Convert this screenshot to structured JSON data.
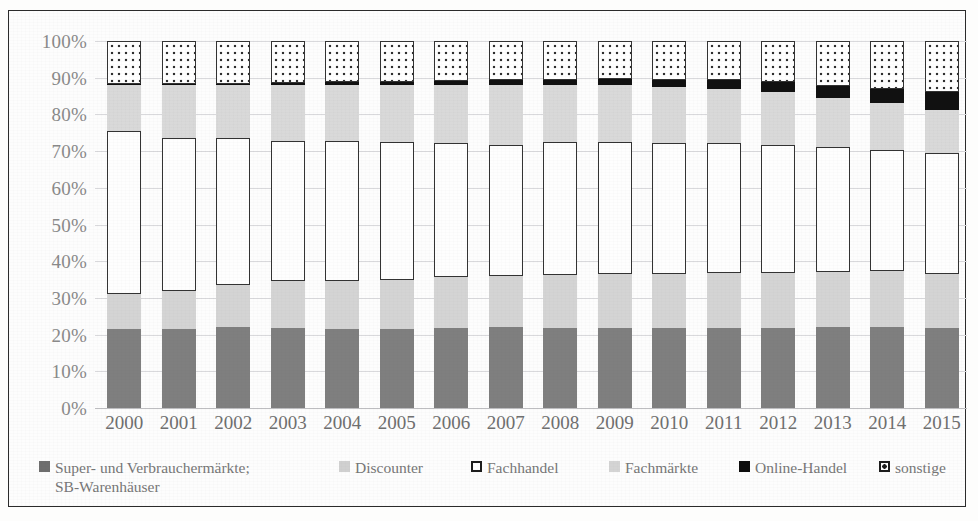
{
  "chart_data": {
    "type": "bar",
    "subtype": "stacked-percentage",
    "title": "",
    "xlabel": "",
    "ylabel": "",
    "ylim": [
      0,
      100
    ],
    "grid": true,
    "legend_position": "bottom",
    "ytick_labels": [
      "100%",
      "90%",
      "80%",
      "70%",
      "60%",
      "50%",
      "40%",
      "30%",
      "20%",
      "10%",
      "0%"
    ],
    "ytick_values": [
      100,
      90,
      80,
      70,
      60,
      50,
      40,
      30,
      20,
      10,
      0
    ],
    "categories": [
      "2000",
      "2001",
      "2002",
      "2003",
      "2004",
      "2005",
      "2006",
      "2007",
      "2008",
      "2009",
      "2010",
      "2011",
      "2012",
      "2013",
      "2014",
      "2015"
    ],
    "series": [
      {
        "name": "Super- und Verbrauchermärkte; SB-Warenhäuser",
        "color": "#7f7f7f",
        "values": [
          21.5,
          21.5,
          22.0,
          21.8,
          21.5,
          21.5,
          21.8,
          22.0,
          21.8,
          21.8,
          21.8,
          21.8,
          21.8,
          22.0,
          22.0,
          21.8
        ]
      },
      {
        "name": "Discounter",
        "color": "#d4d4d4",
        "values": [
          9.5,
          10.5,
          11.5,
          12.8,
          13.2,
          13.5,
          13.8,
          14.0,
          14.5,
          14.8,
          14.8,
          15.0,
          15.0,
          15.0,
          15.2,
          14.8
        ]
      },
      {
        "name": "Fachhandel",
        "color": "#fefefe",
        "values": [
          44.5,
          41.5,
          40.0,
          38.2,
          38.0,
          37.5,
          36.6,
          35.8,
          36.2,
          35.8,
          35.6,
          35.4,
          35.0,
          34.2,
          33.2,
          32.8
        ]
      },
      {
        "name": "Fachmärkte",
        "color": "#d9d9d9",
        "values": [
          12.5,
          14.5,
          14.5,
          15.2,
          15.3,
          15.5,
          15.8,
          16.2,
          15.5,
          15.6,
          15.3,
          14.8,
          14.2,
          13.3,
          12.6,
          11.8
        ]
      },
      {
        "name": "Online-Handel",
        "color": "#111111",
        "values": [
          0.2,
          0.3,
          0.4,
          0.5,
          0.7,
          0.9,
          1.1,
          1.3,
          1.5,
          1.7,
          2.0,
          2.4,
          2.8,
          3.3,
          4.0,
          4.8
        ]
      },
      {
        "name": "sonstige",
        "color": "#ffffff",
        "pattern": "dotted",
        "values": [
          11.8,
          11.7,
          11.6,
          11.5,
          11.3,
          11.1,
          10.9,
          10.7,
          10.5,
          10.3,
          10.5,
          10.6,
          11.2,
          12.2,
          13.0,
          14.0
        ]
      }
    ]
  },
  "legend": {
    "items": [
      {
        "label_line1": "Super- und Verbrauchermärkte;",
        "label_line2": "SB-Warenhäuser",
        "swatch": "sw-super"
      },
      {
        "label_line1": "Discounter",
        "label_line2": "",
        "swatch": "sw-disc"
      },
      {
        "label_line1": "Fachhandel",
        "label_line2": "",
        "swatch": "sw-fach"
      },
      {
        "label_line1": "Fachmärkte",
        "label_line2": "",
        "swatch": "sw-fm"
      },
      {
        "label_line1": "Online-Handel",
        "label_line2": "",
        "swatch": "sw-online"
      },
      {
        "label_line1": "sonstige",
        "label_line2": "",
        "swatch": "sw-sonst"
      }
    ]
  }
}
